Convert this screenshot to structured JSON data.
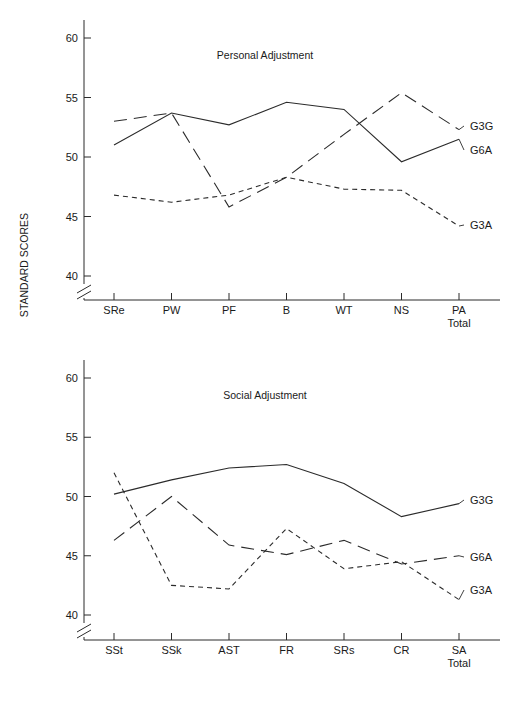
{
  "figure": {
    "ylabel": "STANDARD SCORES",
    "background": "#ffffff",
    "line_color": "#2b2b2b"
  },
  "chart_data": [
    {
      "type": "line",
      "title": "Personal Adjustment",
      "xlabel": "",
      "ylabel": "STANDARD SCORES",
      "categories": [
        "SRe",
        "PW",
        "PF",
        "B",
        "WT",
        "NS",
        "PA"
      ],
      "category_sublabels": [
        "",
        "",
        "",
        "",
        "",
        "",
        "Total"
      ],
      "yticks": [
        40,
        45,
        50,
        55,
        60
      ],
      "ylim": [
        38,
        61
      ],
      "axis_break": true,
      "grid": false,
      "legend_position": "right-inline",
      "series": [
        {
          "name": "G6A",
          "style": "solid",
          "values": [
            51.0,
            53.7,
            52.7,
            54.6,
            54.0,
            49.6,
            51.5
          ]
        },
        {
          "name": "G3G",
          "style": "longdash",
          "values": [
            53.0,
            53.7,
            45.8,
            48.3,
            51.9,
            55.4,
            52.3
          ]
        },
        {
          "name": "G3A",
          "style": "finedash",
          "values": [
            46.8,
            46.2,
            46.8,
            48.3,
            47.3,
            47.2,
            44.2
          ]
        }
      ]
    },
    {
      "type": "line",
      "title": "Social Adjustment",
      "xlabel": "",
      "ylabel": "STANDARD SCORES",
      "categories": [
        "SSt",
        "SSk",
        "AST",
        "FR",
        "SRs",
        "CR",
        "SA"
      ],
      "category_sublabels": [
        "",
        "",
        "",
        "",
        "",
        "",
        "Total"
      ],
      "yticks": [
        40,
        45,
        50,
        55,
        60
      ],
      "ylim": [
        38,
        61
      ],
      "axis_break": true,
      "grid": false,
      "legend_position": "right-inline",
      "series": [
        {
          "name": "G3G",
          "style": "solid",
          "values": [
            50.2,
            51.4,
            52.4,
            52.7,
            51.1,
            48.3,
            49.4
          ]
        },
        {
          "name": "G6A",
          "style": "longdash",
          "values": [
            46.3,
            50.0,
            45.9,
            45.1,
            46.3,
            44.3,
            45.0
          ]
        },
        {
          "name": "G3A",
          "style": "finedash",
          "values": [
            52.0,
            42.5,
            42.2,
            47.3,
            43.9,
            44.5,
            41.3
          ]
        }
      ]
    }
  ]
}
